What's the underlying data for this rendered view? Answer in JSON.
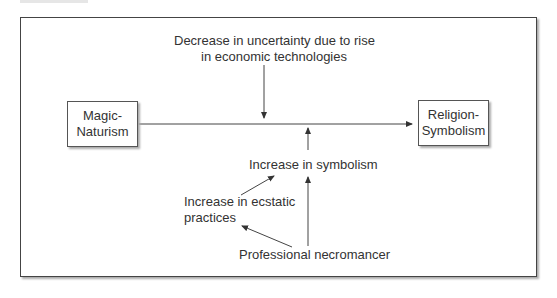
{
  "diagram": {
    "nodes": {
      "magic": {
        "line1": "Magic-",
        "line2": "Naturism"
      },
      "religion": {
        "line1": "Religion-",
        "line2": "Symbolism"
      }
    },
    "labels": {
      "uncertainty_line1": "Decrease in uncertainty due to rise",
      "uncertainty_line2": "in economic technologies",
      "symbolism": "Increase in symbolism",
      "ecstatic_line1": "Increase in ecstatic",
      "ecstatic_line2": "practices",
      "necromancer": "Professional necromancer"
    },
    "edges": [
      {
        "from": "Magic-Naturism",
        "to": "Religion-Symbolism"
      },
      {
        "from": "Decrease in uncertainty due to rise in economic technologies",
        "to": "main-arrow"
      },
      {
        "from": "Increase in symbolism",
        "to": "main-arrow"
      },
      {
        "from": "Increase in ecstatic practices",
        "to": "Increase in symbolism"
      },
      {
        "from": "Professional necromancer",
        "to": "Increase in ecstatic practices"
      },
      {
        "from": "Professional necromancer",
        "to": "Increase in symbolism"
      }
    ]
  }
}
